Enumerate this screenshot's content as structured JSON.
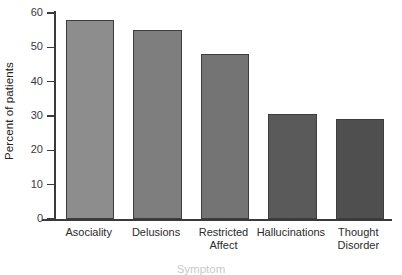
{
  "chart_data": {
    "type": "bar",
    "title": "",
    "subtitle": "",
    "xlabel": "Symptom",
    "ylabel": "Percent of patients",
    "categories": [
      "Asociality",
      "Delusions",
      "Restricted Affect",
      "Hallucinations",
      "Thought Disorder"
    ],
    "category_lines": [
      [
        "Asociality"
      ],
      [
        "Delusions"
      ],
      [
        "Restricted",
        "Affect"
      ],
      [
        "Hallucinations"
      ],
      [
        "Thought",
        "Disorder"
      ]
    ],
    "values": [
      58,
      55,
      48,
      30.5,
      29
    ],
    "bar_colors": [
      "#8d8d8d",
      "#7e7e7e",
      "#747474",
      "#5a5a5a",
      "#4f4f4f"
    ],
    "ylim": [
      0,
      60
    ],
    "yticks": [
      0,
      10,
      20,
      30,
      40,
      50,
      60
    ],
    "ytick_labels": [
      "0",
      "10",
      "20",
      "30",
      "40",
      "50",
      "60"
    ],
    "grid": false,
    "legend": false,
    "legend_position": "none",
    "axis_color": "#3a3a3a",
    "bar_edge_color": "#3d3d3d",
    "background": "#ffffff"
  }
}
